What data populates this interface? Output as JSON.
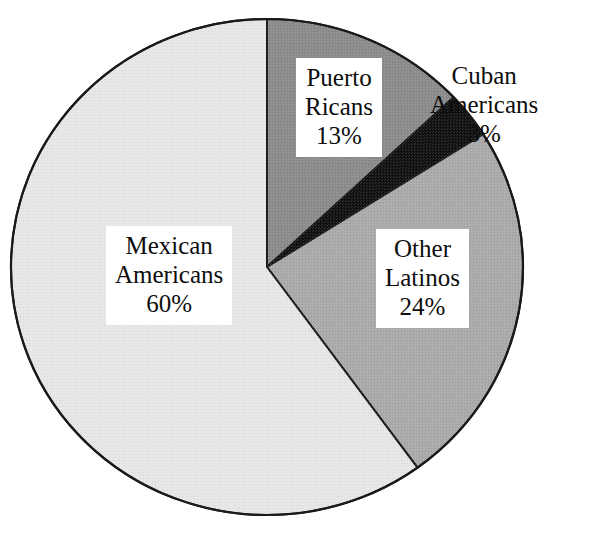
{
  "figure": {
    "top_caption_fragment": "",
    "background_color": "#ffffff",
    "outline_color": "#1a1a1a"
  },
  "chart_data": {
    "type": "pie",
    "title": "",
    "subtitle": "",
    "xlabel": "",
    "ylabel": "",
    "legend_position": "none",
    "grid": false,
    "start_angle_deg": 0,
    "direction": "clockwise",
    "units": "percent",
    "total": 100,
    "categories": [
      "Puerto Ricans",
      "Cuban Americans",
      "Other Latinos",
      "Mexican Americans"
    ],
    "values": [
      13,
      3,
      24,
      60
    ],
    "slices": [
      {
        "name": "puerto-ricans",
        "label_line1": "Puerto",
        "label_line2": "Ricans",
        "value_label": "13%",
        "value": 13,
        "color": "#8a8a8a",
        "label_boxed": true,
        "label_inside": true
      },
      {
        "name": "cuban-americans",
        "label_line1": "Cuban",
        "label_line2": "Americans",
        "value_label": "3%",
        "value": 3,
        "color": "#111111",
        "label_boxed": false,
        "label_inside": false
      },
      {
        "name": "other-latinos",
        "label_line1": "Other",
        "label_line2": "Latinos",
        "value_label": "24%",
        "value": 24,
        "color": "#a9a9a9",
        "label_boxed": true,
        "label_inside": true
      },
      {
        "name": "mexican-americans",
        "label_line1": "Mexican",
        "label_line2": "Americans",
        "value_label": "60%",
        "value": 60,
        "color": "#e6e6e6",
        "label_boxed": true,
        "label_inside": true
      }
    ],
    "geometry": {
      "center_x": 267,
      "center_y": 267,
      "radius_x": 256,
      "radius_y": 248
    }
  }
}
